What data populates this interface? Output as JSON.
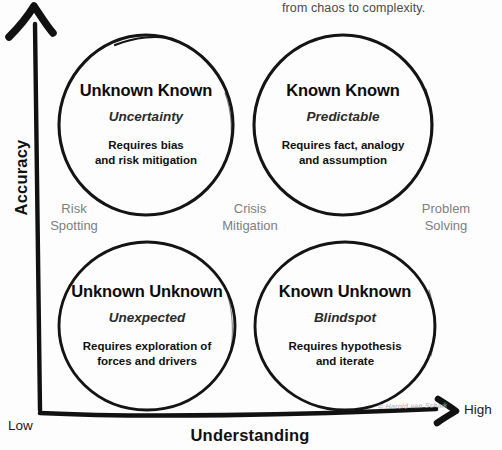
{
  "headline": {
    "text": "from chaos to complexity."
  },
  "axes": {
    "y_title": "Accuracy",
    "x_title": "Understanding",
    "origin_label": "Low",
    "max_label": "High",
    "ink_color": "#111111"
  },
  "quadrants": [
    {
      "id": "unknown-known",
      "title": "Unknown Known",
      "subtitle": "Uncertainty",
      "description": "Requires bias\nand risk mitigation"
    },
    {
      "id": "known-known",
      "title": "Known Known",
      "subtitle": "Predictable",
      "description": "Requires fact, analogy\nand assumption"
    },
    {
      "id": "unknown-unknown",
      "title": "Unknown Unknown",
      "subtitle": "Unexpected",
      "description": "Requires exploration of\nforces and drivers"
    },
    {
      "id": "known-unknown",
      "title": "Known Unknown",
      "subtitle": "Blindspot",
      "description": "Requires hypothesis\nand iterate"
    }
  ],
  "quadrant_captions": [
    {
      "id": "risk-spotting",
      "text": "Risk\nSpotting"
    },
    {
      "id": "crisis-mitigation",
      "text": "Crisis\nMitigation"
    },
    {
      "id": "problem-solving",
      "text": "Problem\nSolving"
    }
  ],
  "signature": {
    "text": "© Harold van Schaik"
  },
  "colors": {
    "background": "#fdfdfd",
    "ink": "#111111",
    "caption_grey": "#7f7f7f",
    "headline_grey": "#4a4a4a"
  }
}
